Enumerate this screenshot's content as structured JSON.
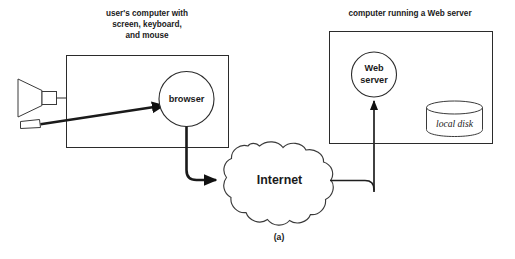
{
  "figure": {
    "caption_label": "(a)",
    "client_caption_lines": [
      "user's computer with",
      "screen, keyboard,",
      "and mouse"
    ],
    "server_caption": "computer running a Web server",
    "nodes": {
      "browser": "browser",
      "web_server_lines": [
        "Web",
        "server"
      ],
      "internet": "Internet",
      "local_disk": "local disk"
    },
    "icons": {
      "monitor": "monitor-icon",
      "mouse": "mouse-icon",
      "disk": "disk-cylinder-icon"
    },
    "colors": {
      "background": "#ffffff",
      "line": "#2b2b2b",
      "text": "#1a1a1a",
      "thick_link": "#1a1a1a"
    }
  }
}
